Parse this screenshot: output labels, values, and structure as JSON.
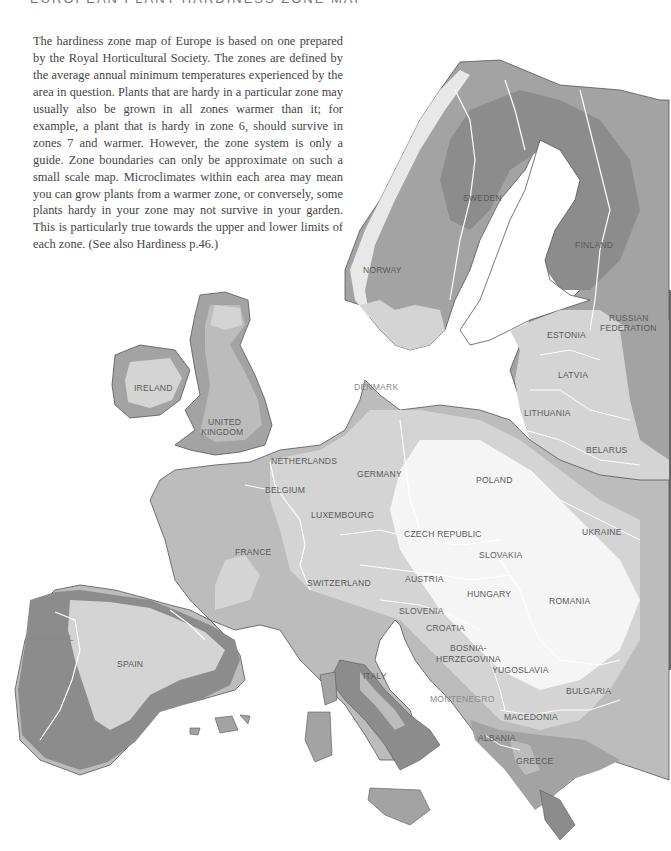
{
  "heading": "EUROPEAN PLANT HARDINESS ZONE MAP",
  "intro_text": "The hardiness zone map of Europe is based on one prepared by the Royal Horticultural Society. The zones are defined by the average annual minimum temperatures experienced by the area in question. Plants that are hardy in a particular zone may usually also be grown in all zones warmer than it; for example, a plant that is hardy in zone 6, should survive in zones 7 and warmer. However, the zone system is only a guide. Zone boundaries can only be approximate on such a small scale map. Microclimates within each area may mean you can grow plants from a warmer zone, or conversely, some plants hardy in your zone may not survive in your garden. This is particularly true towards the upper and lower limits of each zone. (See also Hardiness p.46.)",
  "colors": {
    "zone_coldest": "#8c8c8c",
    "zone_cold": "#a3a3a3",
    "zone_mid": "#bcbcbc",
    "zone_mild": "#d4d4d4",
    "zone_warm": "#e8e8e8",
    "zone_warmest": "#f5f5f5",
    "border": "#ffffff",
    "coast": "#555555"
  },
  "countries": [
    {
      "name": "SWEDEN",
      "x": 463,
      "y": 193
    },
    {
      "name": "FINLAND",
      "x": 575,
      "y": 240
    },
    {
      "name": "NORWAY",
      "x": 363,
      "y": 265
    },
    {
      "name": "RUSSIAN",
      "x": 609,
      "y": 313
    },
    {
      "name": "FEDERATION",
      "x": 600,
      "y": 323
    },
    {
      "name": "ESTONIA",
      "x": 547,
      "y": 330
    },
    {
      "name": "LATVIA",
      "x": 558,
      "y": 370
    },
    {
      "name": "LITHUANIA",
      "x": 524,
      "y": 408
    },
    {
      "name": "BELARUS",
      "x": 586,
      "y": 445
    },
    {
      "name": "IRELAND",
      "x": 134,
      "y": 383
    },
    {
      "name": "UNITED",
      "x": 208,
      "y": 417
    },
    {
      "name": "KINGDOM",
      "x": 201,
      "y": 427
    },
    {
      "name": "DENMARK",
      "x": 354,
      "y": 382
    },
    {
      "name": "NETHERLANDS",
      "x": 271,
      "y": 456
    },
    {
      "name": "GERMANY",
      "x": 357,
      "y": 469
    },
    {
      "name": "POLAND",
      "x": 476,
      "y": 475
    },
    {
      "name": "BELGIUM",
      "x": 265,
      "y": 485
    },
    {
      "name": "LUXEMBOURG",
      "x": 311,
      "y": 510
    },
    {
      "name": "CZECH REPUBLIC",
      "x": 404,
      "y": 529
    },
    {
      "name": "UKRAINE",
      "x": 582,
      "y": 527
    },
    {
      "name": "FRANCE",
      "x": 235,
      "y": 547
    },
    {
      "name": "SLOVAKIA",
      "x": 479,
      "y": 550
    },
    {
      "name": "SWITZERLAND",
      "x": 307,
      "y": 578
    },
    {
      "name": "AUSTRIA",
      "x": 405,
      "y": 574
    },
    {
      "name": "HUNGARY",
      "x": 467,
      "y": 589
    },
    {
      "name": "ROMANIA",
      "x": 549,
      "y": 596
    },
    {
      "name": "SLOVENIA",
      "x": 399,
      "y": 606
    },
    {
      "name": "CROATIA",
      "x": 426,
      "y": 623
    },
    {
      "name": "PORTUGAL",
      "x": 25,
      "y": 633
    },
    {
      "name": "SPAIN",
      "x": 117,
      "y": 659
    },
    {
      "name": "BOSNIA-",
      "x": 450,
      "y": 643
    },
    {
      "name": "HERZEGOVINA",
      "x": 436,
      "y": 654
    },
    {
      "name": "YUGOSLAVIA",
      "x": 492,
      "y": 665
    },
    {
      "name": "ITALY",
      "x": 363,
      "y": 671
    },
    {
      "name": "MONTENEGRO",
      "x": 430,
      "y": 694
    },
    {
      "name": "BULGARIA",
      "x": 566,
      "y": 686
    },
    {
      "name": "MACEDONIA",
      "x": 504,
      "y": 712
    },
    {
      "name": "ALBANIA",
      "x": 478,
      "y": 733
    },
    {
      "name": "GREECE",
      "x": 516,
      "y": 756
    }
  ]
}
